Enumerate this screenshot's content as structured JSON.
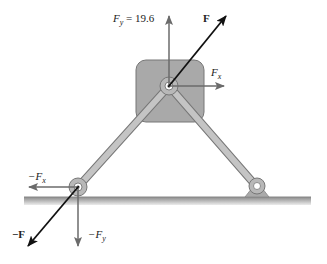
{
  "diagram": {
    "labels": {
      "fy_top": "F",
      "fy_top_sub": "y",
      "fy_top_value": " = 19.6",
      "f_top": "F",
      "fx_right": "F",
      "fx_right_sub": "x",
      "neg_fx": "−F",
      "neg_fx_sub": "x",
      "neg_f": "−F",
      "neg_fy": "−F",
      "neg_fy_sub": "y"
    },
    "colors": {
      "block_fill": "#a9a9a9",
      "member_fill": "#b8b8b8",
      "ground": "#9a9a9a",
      "arrow_gray": "#6b6b6b",
      "arrow_black": "#111111"
    }
  }
}
